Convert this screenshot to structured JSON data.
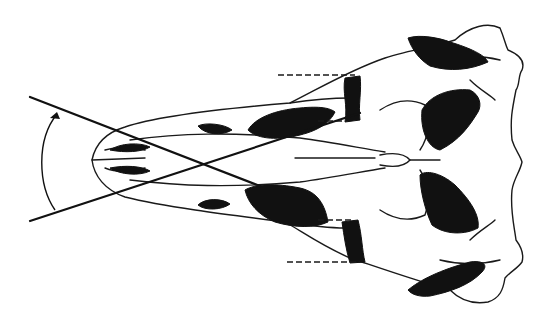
{
  "figure": {
    "type": "line-drawing",
    "colors": {
      "ink": "#111111",
      "background": "#ffffff"
    },
    "annotations": {
      "angle_lines": 2,
      "angle_arc_arrow": "arrow-up",
      "dashed_guides": 4
    }
  }
}
